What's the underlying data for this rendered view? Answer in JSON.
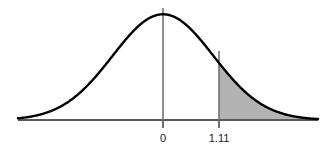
{
  "figure": {
    "name": "standard-normal-curve-right-tail",
    "background_color": "#ffffff",
    "curve_color": "#000000",
    "axis_color": "#595959",
    "marker_line_color": "#6b6b6b",
    "shade_fill_color": "#a6a6a6",
    "shade_opacity": 0.85
  },
  "axis": {
    "x_start_px": 18,
    "x_end_px": 318,
    "baseline_y_px": 120,
    "tick_length_px": 8
  },
  "ticks": [
    {
      "name": "tick-zero",
      "label": "0",
      "x_px": 163,
      "value": 0
    },
    {
      "name": "tick-critical",
      "label": "1.11",
      "x_px": 219,
      "value": 1.11
    }
  ],
  "markers": [
    {
      "name": "center-line",
      "label": "0",
      "x_px": 163,
      "top_y_px": 8,
      "bottom_y_px": 128
    },
    {
      "name": "critical-line",
      "label": "1.11",
      "x_px": 219,
      "top_y_px": 51,
      "bottom_y_px": 128
    }
  ],
  "chart_data": {
    "type": "area",
    "title": "",
    "subtitle": "",
    "xlabel": "",
    "ylabel": "",
    "distribution": "standard normal",
    "mean": 0,
    "sd": 1,
    "xlim": [
      -3.75,
      3.75
    ],
    "ylim": [
      0,
      0.4
    ],
    "grid": false,
    "legend": null,
    "tick_labels": [
      "0",
      "1.11"
    ],
    "tick_values": [
      0,
      1.11
    ],
    "shaded_region": {
      "name": "right-tail",
      "from": 1.11,
      "to": 3.75,
      "label": ""
    },
    "x": [
      -3.75,
      -3.5,
      -3.25,
      -3,
      -2.75,
      -2.5,
      -2.25,
      -2,
      -1.75,
      -1.5,
      -1.25,
      -1,
      -0.75,
      -0.5,
      -0.25,
      0,
      0.25,
      0.5,
      0.75,
      1,
      1.11,
      1.25,
      1.5,
      1.75,
      2,
      2.25,
      2.5,
      2.75,
      3,
      3.25,
      3.5,
      3.75
    ],
    "values": [
      0.0004,
      0.0009,
      0.002,
      0.0044,
      0.0091,
      0.0175,
      0.0317,
      0.054,
      0.0863,
      0.1295,
      0.1826,
      0.242,
      0.3011,
      0.3521,
      0.3867,
      0.3989,
      0.3867,
      0.3521,
      0.3011,
      0.242,
      0.2155,
      0.1826,
      0.1295,
      0.0863,
      0.054,
      0.0317,
      0.0175,
      0.0091,
      0.0044,
      0.002,
      0.0009,
      0.0004
    ]
  }
}
